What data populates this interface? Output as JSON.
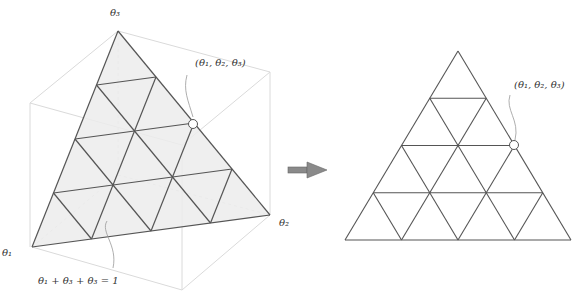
{
  "figure": {
    "left_panel": {
      "axis_labels": {
        "theta3": "θ₃",
        "theta1": "θ₁",
        "theta2": "θ₂"
      },
      "point_label": "(θ₁, θ₂, θ₃)",
      "constraint_label": "θ₁ + θ₃ + θ₃ = 1",
      "grid_subdivisions": 4,
      "fill_color": "#eeeeee",
      "line_color": "#555555",
      "cube_color": "#d9d9d9"
    },
    "arrow": {
      "color": "#888888",
      "direction": "right"
    },
    "right_panel": {
      "point_label": "(θ₁, θ₂, θ₃)",
      "grid_subdivisions": 4,
      "line_color": "#555555"
    }
  }
}
